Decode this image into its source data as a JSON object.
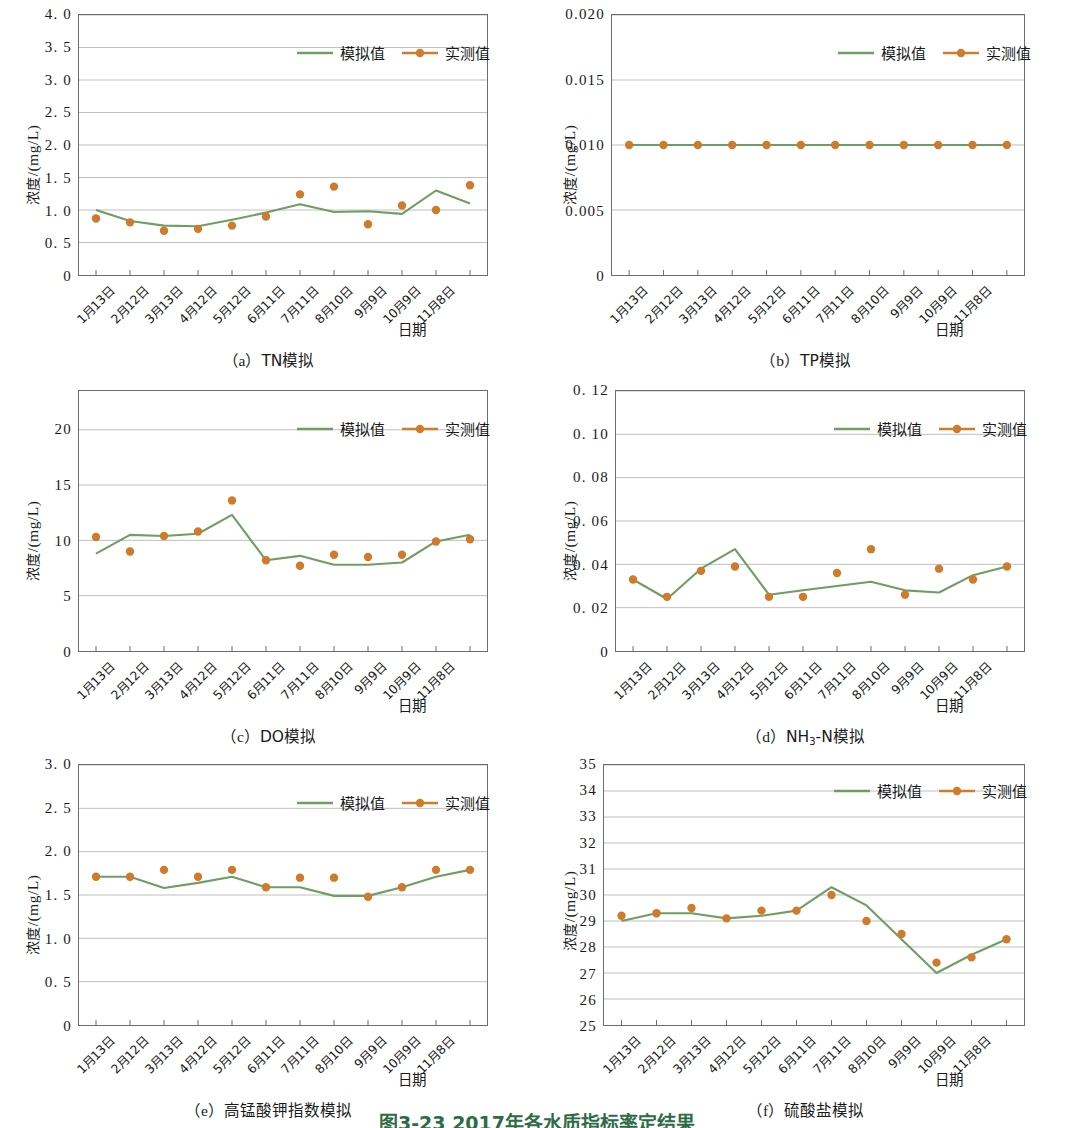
{
  "figure": {
    "caption": "图3-23  2017年各水质指标率定结果",
    "y_axis_title_prefix": "浓度",
    "y_axis_title_unit": "/(mg/L)",
    "x_axis_title": "日期",
    "legend": {
      "simulated": "模拟值",
      "measured": "实测值"
    },
    "colors": {
      "simulated_line": "#6f9e62",
      "measured_marker": "#ce7b2c",
      "measured_line": "#d07c2b",
      "axis": "#6d6d6d",
      "grid": "#b8b8b8"
    },
    "categories": [
      "1月13日",
      "2月12日",
      "3月13日",
      "4月12日",
      "5月12日",
      "6月11日",
      "7月11日",
      "8月10日",
      "9月9日",
      "10月9日",
      "11月8日"
    ]
  },
  "chart_data": [
    {
      "id": "tn",
      "panel": "a",
      "type": "line",
      "title": "（a）TN模拟",
      "caption_lead": "（a）",
      "caption_text": "TN模拟",
      "xlabel": "日期",
      "ylabel": "浓度/(mg/L)",
      "ylim": [
        0,
        4.0
      ],
      "yticks": [
        0,
        0.5,
        1.0,
        1.5,
        2.0,
        2.5,
        3.0,
        3.5,
        4.0
      ],
      "ytick_labels": [
        "0",
        "0. 5",
        "1. 0",
        "1. 5",
        "2. 0",
        "2. 5",
        "3. 0",
        "3. 5",
        "4. 0"
      ],
      "grid": true,
      "legend_position": "top-right",
      "categories": [
        "1月13日",
        "2月12日",
        "3月13日",
        "4月12日",
        "5月12日",
        "6月11日",
        "7月11日",
        "8月10日",
        "9月9日",
        "10月9日",
        "11月8日"
      ],
      "series": [
        {
          "name": "模拟值",
          "type": "line",
          "values": [
            1.0,
            0.83,
            0.76,
            0.75,
            0.85,
            0.96,
            1.09,
            0.97,
            0.98,
            0.94,
            1.3,
            1.1
          ]
        },
        {
          "name": "实测值",
          "type": "scatter",
          "values": [
            0.87,
            0.81,
            0.68,
            0.71,
            0.76,
            0.9,
            1.24,
            1.36,
            0.78,
            1.07,
            1.0,
            1.38
          ]
        }
      ]
    },
    {
      "id": "tp",
      "panel": "b",
      "type": "line",
      "title": "（b）TP模拟",
      "caption_lead": "（b）",
      "caption_text": "TP模拟",
      "xlabel": "日期",
      "ylabel": "浓度/(mg/L)",
      "ylim": [
        0,
        0.02
      ],
      "yticks": [
        0,
        0.005,
        0.01,
        0.015,
        0.02
      ],
      "ytick_labels": [
        "0",
        "0.005",
        "0.010",
        "0.015",
        "0.020"
      ],
      "grid": true,
      "legend_position": "top-right",
      "categories": [
        "1月13日",
        "2月12日",
        "3月13日",
        "4月12日",
        "5月12日",
        "6月11日",
        "7月11日",
        "8月10日",
        "9月9日",
        "10月9日",
        "11月8日"
      ],
      "series": [
        {
          "name": "模拟值",
          "type": "line",
          "values": [
            0.01,
            0.01,
            0.01,
            0.01,
            0.01,
            0.01,
            0.01,
            0.01,
            0.01,
            0.01,
            0.01,
            0.01
          ]
        },
        {
          "name": "实测值",
          "type": "scatter",
          "values": [
            0.01,
            0.01,
            0.01,
            0.01,
            0.01,
            0.01,
            0.01,
            0.01,
            0.01,
            0.01,
            0.01,
            0.01
          ]
        }
      ]
    },
    {
      "id": "do",
      "panel": "c",
      "type": "line",
      "title": "（c）DO模拟",
      "caption_lead": "（c）",
      "caption_text": "DO模拟",
      "xlabel": "日期",
      "ylabel": "浓度/(mg/L)",
      "ylim": [
        0,
        23.5
      ],
      "yticks": [
        0,
        5,
        10,
        15,
        20
      ],
      "ytick_labels": [
        "0",
        "5",
        "10",
        "15",
        "20"
      ],
      "grid": true,
      "legend_position": "top-right",
      "categories": [
        "1月13日",
        "2月12日",
        "3月13日",
        "4月12日",
        "5月12日",
        "6月11日",
        "7月11日",
        "8月10日",
        "9月9日",
        "10月9日",
        "11月8日"
      ],
      "series": [
        {
          "name": "模拟值",
          "type": "line",
          "values": [
            8.8,
            10.5,
            10.4,
            10.6,
            12.3,
            8.2,
            8.6,
            7.8,
            7.8,
            8.0,
            9.9,
            10.5
          ]
        },
        {
          "name": "实测值",
          "type": "scatter",
          "values": [
            10.3,
            9.0,
            10.4,
            10.8,
            13.6,
            8.2,
            7.7,
            8.7,
            8.5,
            8.7,
            9.9,
            10.1
          ]
        }
      ]
    },
    {
      "id": "nh3n",
      "panel": "d",
      "type": "line",
      "title": "（d）NH3-N模拟",
      "caption_lead": "（d）",
      "caption_text_pre": "NH",
      "caption_text_sub": "3",
      "caption_text_post": "-N模拟",
      "xlabel": "日期",
      "ylabel": "浓度/(mg/L)",
      "ylim": [
        0,
        0.12
      ],
      "yticks": [
        0,
        0.02,
        0.04,
        0.06,
        0.08,
        0.1,
        0.12
      ],
      "ytick_labels": [
        "0",
        "0. 02",
        "0. 04",
        "0. 06",
        "0. 08",
        "0. 10",
        "0. 12"
      ],
      "grid": true,
      "legend_position": "top-right",
      "categories": [
        "1月13日",
        "2月12日",
        "3月13日",
        "4月12日",
        "5月12日",
        "6月11日",
        "7月11日",
        "8月10日",
        "9月9日",
        "10月9日",
        "11月8日"
      ],
      "series": [
        {
          "name": "模拟值",
          "type": "line",
          "values": [
            0.033,
            0.024,
            0.038,
            0.047,
            0.026,
            0.028,
            0.03,
            0.032,
            0.028,
            0.027,
            0.035,
            0.039
          ]
        },
        {
          "name": "实测值",
          "type": "scatter",
          "values": [
            0.033,
            0.025,
            0.037,
            0.039,
            0.025,
            0.025,
            0.036,
            0.047,
            0.026,
            0.038,
            0.033,
            0.039
          ]
        }
      ]
    },
    {
      "id": "codmn",
      "panel": "e",
      "type": "line",
      "title": "（e）高锰酸钾指数模拟",
      "caption_lead": "（e）",
      "caption_text": "高锰酸钾指数模拟",
      "xlabel": "日期",
      "ylabel": "浓度/(mg/L)",
      "ylim": [
        0,
        3.0
      ],
      "yticks": [
        0,
        0.5,
        1.0,
        1.5,
        2.0,
        2.5,
        3.0
      ],
      "ytick_labels": [
        "0",
        "0. 5",
        "1. 0",
        "1. 5",
        "2. 0",
        "2. 5",
        "3. 0"
      ],
      "grid": true,
      "legend_position": "top-right",
      "categories": [
        "1月13日",
        "2月12日",
        "3月13日",
        "4月12日",
        "5月12日",
        "6月11日",
        "7月11日",
        "8月10日",
        "9月9日",
        "10月9日",
        "11月8日"
      ],
      "series": [
        {
          "name": "模拟值",
          "type": "line",
          "values": [
            1.71,
            1.71,
            1.58,
            1.64,
            1.71,
            1.59,
            1.59,
            1.49,
            1.49,
            1.59,
            1.71,
            1.79
          ]
        },
        {
          "name": "实测值",
          "type": "scatter",
          "values": [
            1.71,
            1.71,
            1.79,
            1.71,
            1.79,
            1.59,
            1.7,
            1.7,
            1.48,
            1.59,
            1.79,
            1.79
          ]
        }
      ]
    },
    {
      "id": "sulfate",
      "panel": "f",
      "type": "line",
      "title": "（f）硫酸盐模拟",
      "caption_lead": "（f）",
      "caption_text": "硫酸盐模拟",
      "xlabel": "日期",
      "ylabel": "浓度/(mg/L)",
      "ylim": [
        25,
        35
      ],
      "yticks": [
        25,
        26,
        27,
        28,
        29,
        30,
        31,
        32,
        33,
        34,
        35
      ],
      "ytick_labels": [
        "25",
        "26",
        "27",
        "28",
        "29",
        "30",
        "31",
        "32",
        "33",
        "34",
        "35"
      ],
      "grid": true,
      "legend_position": "top-right",
      "categories": [
        "1月13日",
        "2月12日",
        "3月13日",
        "4月12日",
        "5月12日",
        "6月11日",
        "7月11日",
        "8月10日",
        "9月9日",
        "10月9日",
        "11月8日"
      ],
      "series": [
        {
          "name": "模拟值",
          "type": "line",
          "values": [
            29.0,
            29.3,
            29.3,
            29.1,
            29.2,
            29.4,
            30.3,
            29.6,
            28.3,
            27.0,
            27.7,
            28.3
          ]
        },
        {
          "name": "实测值",
          "type": "scatter",
          "values": [
            29.2,
            29.3,
            29.5,
            29.1,
            29.4,
            29.4,
            30.0,
            29.0,
            28.5,
            27.4,
            27.6,
            28.3
          ]
        }
      ]
    }
  ]
}
